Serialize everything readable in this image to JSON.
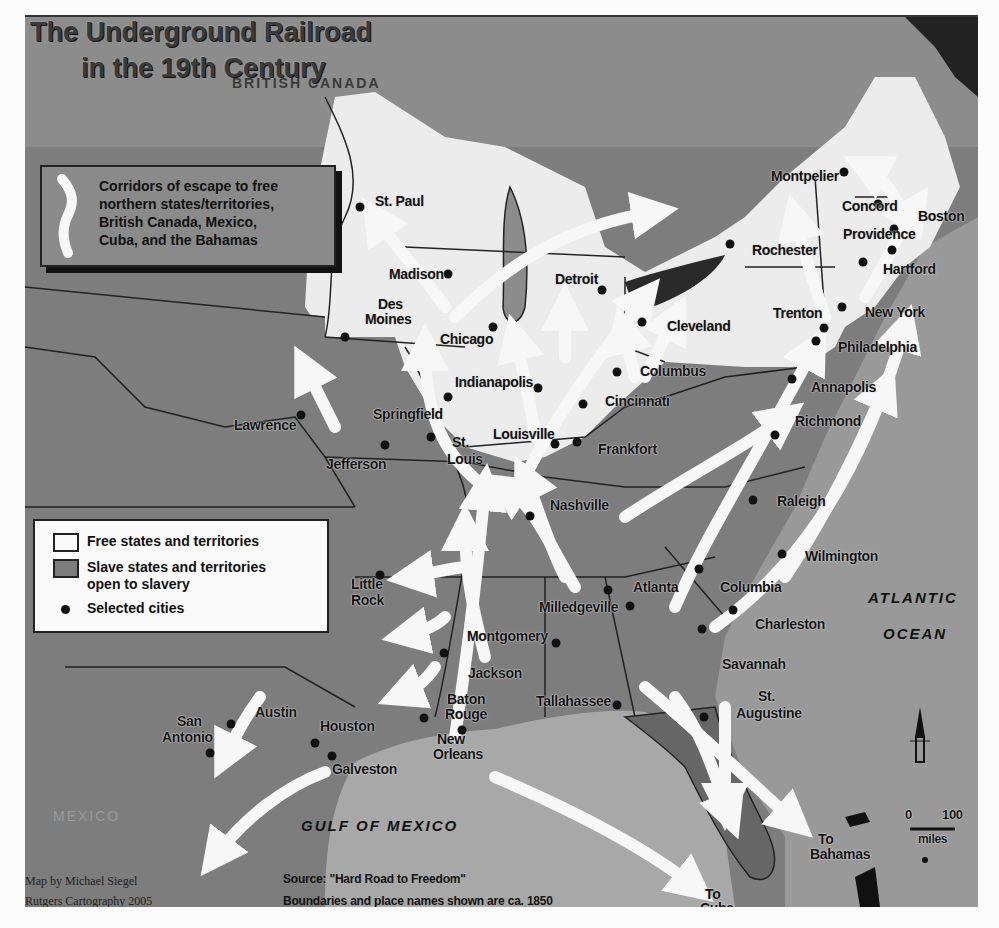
{
  "title": {
    "line1": "The Underground Railroad",
    "line2": "in the 19th Century"
  },
  "regions": {
    "british_canada": "BRITISH CANADA",
    "mexico": "MEXICO",
    "gulf_of_mexico": "GULF OF MEXICO",
    "atlantic_line1": "ATLANTIC",
    "atlantic_line2": "OCEAN"
  },
  "legend_routes": {
    "text": [
      "Corridors of escape to free",
      "northern states/territories,",
      "British Canada, Mexico,",
      "Cuba, and the Bahamas"
    ]
  },
  "legend_states": {
    "free": "Free states and territories",
    "slave_line1": "Slave states and territories",
    "slave_line2": "open to slavery",
    "cities": "Selected cities",
    "free_color": "#fafafa",
    "slave_color": "#7d7d7d"
  },
  "cities": [
    {
      "name": "St. Paul",
      "x": 350,
      "y": 197
    },
    {
      "name": "Madison",
      "x": 438,
      "y": 264
    },
    {
      "name": "Des Moines",
      "x": 335,
      "y": 327
    },
    {
      "name": "Chicago",
      "x": 483,
      "y": 317
    },
    {
      "name": "Detroit",
      "x": 592,
      "y": 280
    },
    {
      "name": "Cleveland",
      "x": 632,
      "y": 312
    },
    {
      "name": "Columbus",
      "x": 607,
      "y": 362
    },
    {
      "name": "Indianapolis",
      "x": 528,
      "y": 378
    },
    {
      "name": "Springfield",
      "x": 438,
      "y": 387
    },
    {
      "name": "Lawrence",
      "x": 291,
      "y": 405
    },
    {
      "name": "Jefferson",
      "x": 375,
      "y": 435
    },
    {
      "name": "St. Louis",
      "x": 421,
      "y": 427
    },
    {
      "name": "Louisville",
      "x": 545,
      "y": 434
    },
    {
      "name": "Cincinnati",
      "x": 573,
      "y": 394
    },
    {
      "name": "Frankfort",
      "x": 567,
      "y": 432
    },
    {
      "name": "Nashville",
      "x": 520,
      "y": 506
    },
    {
      "name": "Little Rock",
      "x": 370,
      "y": 565
    },
    {
      "name": "Atlanta",
      "x": 598,
      "y": 580
    },
    {
      "name": "Milledgeville",
      "x": 620,
      "y": 596
    },
    {
      "name": "Montgomery",
      "x": 546,
      "y": 633
    },
    {
      "name": "Jackson",
      "x": 434,
      "y": 643
    },
    {
      "name": "Baton Rouge",
      "x": 414,
      "y": 708
    },
    {
      "name": "New Orleans",
      "x": 452,
      "y": 720
    },
    {
      "name": "Tallahassee",
      "x": 607,
      "y": 695
    },
    {
      "name": "Columbia",
      "x": 689,
      "y": 559
    },
    {
      "name": "Charleston",
      "x": 723,
      "y": 600
    },
    {
      "name": "Savannah",
      "x": 692,
      "y": 619
    },
    {
      "name": "St. Augustine",
      "x": 694,
      "y": 707
    },
    {
      "name": "Wilmington",
      "x": 772,
      "y": 544
    },
    {
      "name": "Raleigh",
      "x": 743,
      "y": 490
    },
    {
      "name": "Richmond",
      "x": 765,
      "y": 425
    },
    {
      "name": "Annapolis",
      "x": 782,
      "y": 369
    },
    {
      "name": "Philadelphia",
      "x": 806,
      "y": 331
    },
    {
      "name": "Trenton",
      "x": 814,
      "y": 318
    },
    {
      "name": "New York",
      "x": 832,
      "y": 297
    },
    {
      "name": "Hartford",
      "x": 853,
      "y": 252
    },
    {
      "name": "Providence",
      "x": 882,
      "y": 240
    },
    {
      "name": "Boston",
      "x": 884,
      "y": 219
    },
    {
      "name": "Concord",
      "x": 868,
      "y": 194
    },
    {
      "name": "Montpelier",
      "x": 834,
      "y": 162
    },
    {
      "name": "Rochester",
      "x": 720,
      "y": 234
    },
    {
      "name": "Austin",
      "x": 221,
      "y": 714
    },
    {
      "name": "San Antonio",
      "x": 200,
      "y": 743
    },
    {
      "name": "Houston",
      "x": 305,
      "y": 733
    },
    {
      "name": "Galveston",
      "x": 322,
      "y": 746
    }
  ],
  "city_labels": {
    "st_paul": "St. Paul",
    "madison": "Madison",
    "des_moines_1": "Des",
    "des_moines_2": "Moines",
    "chicago": "Chicago",
    "detroit": "Detroit",
    "cleveland": "Cleveland",
    "columbus": "Columbus",
    "indianapolis": "Indianapolis",
    "springfield": "Springfield",
    "lawrence": "Lawrence",
    "jefferson": "Jefferson",
    "st_louis_1": "St.",
    "st_louis_2": "Louis",
    "louisville": "Louisville",
    "cincinnati": "Cincinnati",
    "frankfort": "Frankfort",
    "nashville": "Nashville",
    "little_rock_1": "Little",
    "little_rock_2": "Rock",
    "atlanta": "Atlanta",
    "milledgeville": "Milledgeville",
    "montgomery": "Montgomery",
    "jackson": "Jackson",
    "baton_rouge_1": "Baton",
    "baton_rouge_2": "Rouge",
    "new_orleans_1": "New",
    "new_orleans_2": "Orleans",
    "tallahassee": "Tallahassee",
    "columbia": "Columbia",
    "charleston": "Charleston",
    "savannah": "Savannah",
    "st_augustine_1": "St.",
    "st_augustine_2": "Augustine",
    "wilmington": "Wilmington",
    "raleigh": "Raleigh",
    "richmond": "Richmond",
    "annapolis": "Annapolis",
    "philadelphia": "Philadelphia",
    "trenton": "Trenton",
    "new_york": "New York",
    "hartford": "Hartford",
    "providence": "Providence",
    "boston": "Boston",
    "concord": "Concord",
    "montpelier": "Montpelier",
    "rochester": "Rochester",
    "austin": "Austin",
    "san_antonio_1": "San",
    "san_antonio_2": "Antonio",
    "houston": "Houston",
    "galveston": "Galveston"
  },
  "destinations": {
    "cuba_1": "To",
    "cuba_2": "Cuba",
    "bahamas_1": "To",
    "bahamas_2": "Bahamas"
  },
  "scale_bar": {
    "start": "0",
    "end": "100",
    "unit": "miles"
  },
  "credits": {
    "author": "Map by Michael Siegel",
    "org": "Rutgers Cartography 2005"
  },
  "source": {
    "line1": "Source: \"Hard Road to Freedom\"",
    "line2": "Boundaries and place names shown are ca. 1850"
  },
  "colors": {
    "free_states": "#eeeeee",
    "slave_states": "#7d7d7d",
    "water": "#a8a8a8",
    "canada": "#8c8c8c",
    "routes": "#f7f7f7",
    "city_dot": "#111111"
  }
}
